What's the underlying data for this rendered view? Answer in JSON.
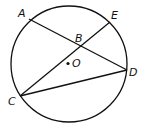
{
  "diagram": {
    "circle": {
      "cx": 69,
      "cy": 64,
      "r": 58
    },
    "center": {
      "label": "O",
      "x": 68,
      "y": 63
    },
    "points": {
      "A": {
        "label": "A",
        "x": 29,
        "y": 19
      },
      "E": {
        "label": "E",
        "x": 110,
        "y": 22
      },
      "B": {
        "label": "B",
        "x": 79,
        "y": 47
      },
      "D": {
        "label": "D",
        "x": 127,
        "y": 70
      },
      "C": {
        "label": "C",
        "x": 20,
        "y": 96
      }
    },
    "segments": [
      "AD",
      "CE",
      "CD"
    ]
  }
}
